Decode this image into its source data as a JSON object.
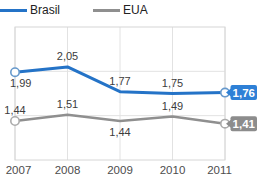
{
  "legend": {
    "items": [
      {
        "label": "Brasil",
        "color": "#2473c7"
      },
      {
        "label": "EUA",
        "color": "#8f8f8f"
      }
    ]
  },
  "chart_data": {
    "type": "line",
    "title": "",
    "xlabel": "",
    "ylabel": "",
    "categories": [
      "2007",
      "2008",
      "2009",
      "2010",
      "2011"
    ],
    "series": [
      {
        "name": "Brasil",
        "color": "#2473c7",
        "marker_stroke": "#6699cc",
        "badge_color": "#2e80d6",
        "stroke_width": 3,
        "values": [
          1.99,
          2.05,
          1.77,
          1.75,
          1.76
        ],
        "labels": [
          "1,99",
          "2,05",
          "1,77",
          "1,75",
          "1,76"
        ],
        "label_pos": [
          "below",
          "above",
          "above",
          "above",
          "badge"
        ],
        "markers": [
          0,
          4
        ]
      },
      {
        "name": "EUA",
        "color": "#8f8f8f",
        "marker_stroke": "#ababab",
        "badge_color": "#8c8c8c",
        "stroke_width": 2.5,
        "values": [
          1.44,
          1.51,
          1.44,
          1.49,
          1.41
        ],
        "labels": [
          "1,44",
          "1,51",
          "1,44",
          "1,49",
          "1,41"
        ],
        "label_pos": [
          "above",
          "above",
          "below",
          "above",
          "badge"
        ],
        "markers": [
          0,
          4
        ]
      }
    ],
    "ylim": [
      1.0,
      2.5
    ],
    "grid": {
      "vertical": true,
      "horizontal_values": [
        1.5,
        2.0
      ]
    },
    "legend_position": "top-left",
    "colors": {
      "grid_line": "#e2e2e2",
      "plot_border": "#d6d6d6",
      "value_label_text": "#3c3c3c",
      "axis_label_text": "#4d4d4d",
      "badge_text": "#ffffff"
    }
  }
}
